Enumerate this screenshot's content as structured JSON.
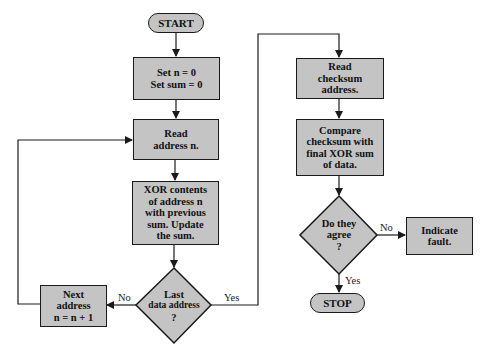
{
  "diagram": {
    "type": "flowchart",
    "nodes": {
      "start": {
        "shape": "terminal",
        "label": "START"
      },
      "init": {
        "shape": "process",
        "lines": [
          "Set n = 0",
          "Set sum = 0"
        ]
      },
      "read_address": {
        "shape": "process",
        "lines": [
          "Read",
          "address n."
        ]
      },
      "xor": {
        "shape": "process",
        "lines": [
          "XOR contents",
          "of address n",
          "with previous",
          "sum.  Update",
          "the sum."
        ]
      },
      "last_check": {
        "shape": "decision",
        "lines": [
          "Last",
          "data address",
          "?"
        ]
      },
      "next_address": {
        "shape": "process",
        "lines": [
          "Next",
          "address",
          "n = n + 1"
        ]
      },
      "read_checksum": {
        "shape": "process",
        "lines": [
          "Read",
          "checksum",
          "address."
        ]
      },
      "compare": {
        "shape": "process",
        "lines": [
          "Compare",
          "checksum with",
          "final XOR sum",
          "of data."
        ]
      },
      "agree_check": {
        "shape": "decision",
        "lines": [
          "Do they",
          "agree",
          "?"
        ]
      },
      "fault": {
        "shape": "process",
        "lines": [
          "Indicate",
          "fault."
        ]
      },
      "stop": {
        "shape": "terminal",
        "label": "STOP"
      }
    },
    "edge_labels": {
      "last_no": "No",
      "last_yes": "Yes",
      "agree_no": "No",
      "agree_yes": "Yes"
    },
    "colors": {
      "fill": "#c4c4c4",
      "stroke": "#1a1a1a",
      "background": "#ffffff"
    }
  }
}
